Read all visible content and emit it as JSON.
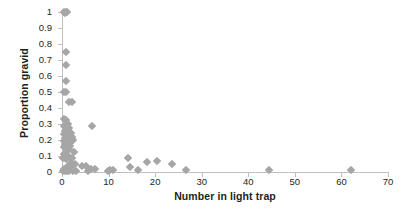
{
  "chart_data": {
    "type": "scatter",
    "title": "",
    "xlabel": "Number in light trap",
    "ylabel": "Proportion gravid",
    "xlim": [
      0,
      70
    ],
    "ylim": [
      0,
      1
    ],
    "xticks": [
      0,
      10,
      20,
      30,
      40,
      50,
      60,
      70
    ],
    "yticks": [
      0,
      0.1,
      0.2,
      0.3,
      0.4,
      0.5,
      0.6,
      0.7,
      0.8,
      0.9,
      1
    ],
    "xtick_labels": [
      "0",
      "10",
      "20",
      "30",
      "40",
      "50",
      "60",
      "70"
    ],
    "ytick_labels": [
      "0",
      "0.1",
      "0.2",
      "0.3",
      "0.4",
      "0.5",
      "0.6",
      "0.7",
      "0.8",
      "0.9",
      "1"
    ],
    "grid": false,
    "legend": null,
    "marker": "diamond",
    "marker_color": "#a6a6a6",
    "axis_color": "#bfbfbf",
    "points": [
      [
        0.4,
        1.0
      ],
      [
        0.8,
        1.0
      ],
      [
        1.1,
        1.0
      ],
      [
        0.6,
        0.995
      ],
      [
        0.9,
        0.75
      ],
      [
        0.8,
        0.67
      ],
      [
        0.9,
        0.57
      ],
      [
        0.5,
        0.5
      ],
      [
        0.8,
        0.5
      ],
      [
        1.6,
        0.44
      ],
      [
        2.1,
        0.435
      ],
      [
        0.5,
        0.33
      ],
      [
        0.9,
        0.325
      ],
      [
        1.3,
        0.3
      ],
      [
        6.5,
        0.29
      ],
      [
        0.5,
        0.285
      ],
      [
        1.0,
        0.28
      ],
      [
        1.6,
        0.275
      ],
      [
        0.6,
        0.255
      ],
      [
        1.2,
        0.25
      ],
      [
        1.9,
        0.245
      ],
      [
        0.5,
        0.235
      ],
      [
        1.0,
        0.23
      ],
      [
        1.5,
        0.225
      ],
      [
        2.2,
        0.22
      ],
      [
        0.6,
        0.215
      ],
      [
        1.1,
        0.21
      ],
      [
        1.7,
        0.205
      ],
      [
        2.4,
        0.2
      ],
      [
        0.5,
        0.195
      ],
      [
        1.0,
        0.19
      ],
      [
        1.4,
        0.185
      ],
      [
        2.0,
        0.185
      ],
      [
        0.6,
        0.175
      ],
      [
        1.2,
        0.17
      ],
      [
        1.8,
        0.165
      ],
      [
        0.5,
        0.155
      ],
      [
        1.1,
        0.15
      ],
      [
        1.6,
        0.145
      ],
      [
        2.6,
        0.125
      ],
      [
        0.4,
        0.115
      ],
      [
        0.9,
        0.11
      ],
      [
        1.5,
        0.095
      ],
      [
        2.2,
        0.09
      ],
      [
        0.3,
        0.085
      ],
      [
        0.8,
        0.08
      ],
      [
        14.2,
        0.085
      ],
      [
        20.4,
        0.07
      ],
      [
        18.2,
        0.06
      ],
      [
        2.0,
        0.055
      ],
      [
        2.8,
        0.05
      ],
      [
        23.6,
        0.05
      ],
      [
        4.3,
        0.04
      ],
      [
        5.2,
        0.035
      ],
      [
        1.3,
        0.035
      ],
      [
        1.9,
        0.03
      ],
      [
        14.7,
        0.03
      ],
      [
        6.2,
        0.02
      ],
      [
        7.0,
        0.02
      ],
      [
        0.4,
        0.02
      ],
      [
        0.9,
        0.018
      ],
      [
        1.4,
        0.015
      ],
      [
        10.2,
        0.015
      ],
      [
        10.9,
        0.012
      ],
      [
        16.3,
        0.012
      ],
      [
        26.6,
        0.012
      ],
      [
        44.5,
        0.012
      ],
      [
        62.0,
        0.015
      ],
      [
        0.2,
        0.005
      ],
      [
        0.6,
        0.005
      ],
      [
        1.0,
        0.005
      ],
      [
        1.5,
        0.004
      ],
      [
        2.3,
        0.004
      ],
      [
        3.1,
        0.004
      ],
      [
        5.6,
        0.004
      ],
      [
        9.8,
        0.004
      ]
    ]
  }
}
